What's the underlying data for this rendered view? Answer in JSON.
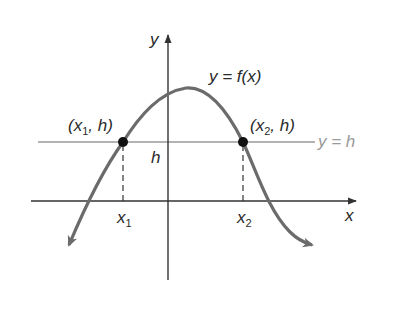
{
  "diagram": {
    "title": "",
    "labels": {
      "y_axis": "y",
      "x_axis": "x",
      "function": "y = f(x)",
      "point1": {
        "pre": "(x",
        "sub": "1",
        "post": ", h)"
      },
      "point2": {
        "pre": "(x",
        "sub": "2",
        "post": ", h)"
      },
      "h_tick": "h",
      "line_label": "y = h",
      "x1": {
        "base": "x",
        "sub": "1"
      },
      "x2": {
        "base": "x",
        "sub": "2"
      }
    },
    "colors": {
      "axes": "#333333",
      "curve": "#6b6b6b",
      "h_line": "#9a9a9a",
      "points": "#111111"
    },
    "elements": [
      "x-axis",
      "y-axis",
      "curve y=f(x)",
      "horizontal line y=h",
      "point (x1,h)",
      "point (x2,h)",
      "dashed drop lines to x1 and x2"
    ]
  }
}
